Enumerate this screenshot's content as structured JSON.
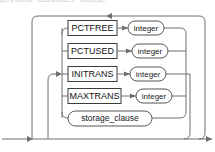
{
  "diagram": {
    "type": "railroad-syntax-diagram",
    "name": "physical_attributes_clause",
    "clipped_caption": "physical_attributes_clause",
    "colors": {
      "line": "#6e6e6e",
      "box_border": "#3b3b3b",
      "round_border": "#555555",
      "text": "#111111",
      "background": "#ffffff"
    },
    "rows": [
      {
        "id": "pctfree",
        "keyword": "PCTFREE",
        "argument": "integer",
        "argument_shape": "rounded"
      },
      {
        "id": "pctused",
        "keyword": "PCTUSED",
        "argument": "integer",
        "argument_shape": "rounded"
      },
      {
        "id": "initrans",
        "keyword": "INITRANS",
        "argument": "integer",
        "argument_shape": "rounded"
      },
      {
        "id": "maxtrans",
        "keyword": "MAXTRANS",
        "argument": "integer",
        "argument_shape": "rounded"
      },
      {
        "id": "storage-clause",
        "keyword": "storage_clause",
        "argument": "",
        "argument_shape": "rounded-nonterminal"
      }
    ],
    "arrows": [
      {
        "id": "loop-back-top",
        "direction": "left"
      },
      {
        "id": "branch-entry",
        "direction": "right"
      },
      {
        "id": "track-entry",
        "direction": "right"
      },
      {
        "id": "track-exit",
        "direction": "right"
      }
    ]
  }
}
